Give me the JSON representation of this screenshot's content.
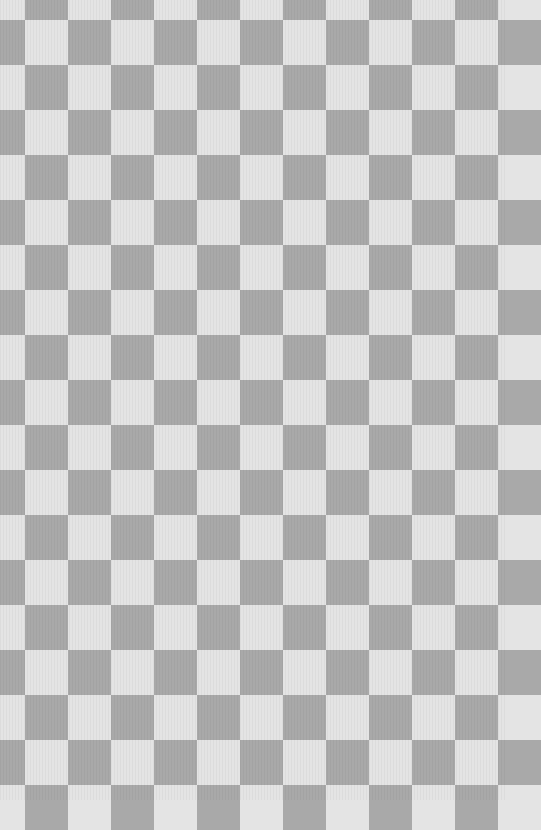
{
  "pattern": {
    "type": "checkerboard",
    "light_color": "#e4e4e4",
    "dark_color": "#a9a9a9",
    "col_offset": -18,
    "col_width": 43,
    "row_offset": -25,
    "row_height": 45,
    "top_left_is_light": true
  }
}
